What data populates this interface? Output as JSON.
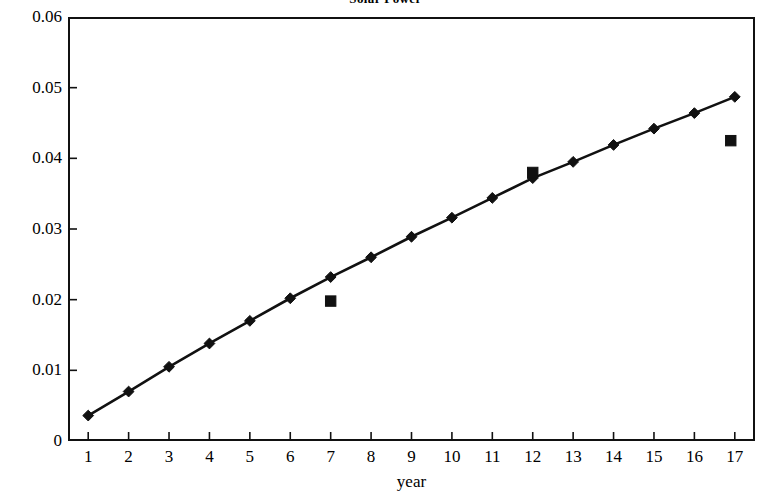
{
  "chart_data": {
    "type": "line",
    "title": "Solar Power",
    "xlabel": "year",
    "ylabel": "",
    "xlim": [
      0.5,
      17.5
    ],
    "ylim": [
      0,
      0.06
    ],
    "grid": false,
    "legend": "none",
    "x_tick_labels": [
      "1",
      "2",
      "3",
      "4",
      "5",
      "6",
      "7",
      "8",
      "9",
      "10",
      "11",
      "12",
      "13",
      "14",
      "15",
      "16",
      "17"
    ],
    "y_tick_labels": [
      "0",
      "0.01",
      "0.02",
      "0.03",
      "0.04",
      "0.05",
      "0.06"
    ],
    "y_tick_values": [
      0,
      0.01,
      0.02,
      0.03,
      0.04,
      0.05,
      0.06
    ],
    "categories": [
      1,
      2,
      3,
      4,
      5,
      6,
      7,
      8,
      9,
      10,
      11,
      12,
      13,
      14,
      15,
      16,
      17
    ],
    "series": [
      {
        "name": "trend",
        "marker": "diamond",
        "line": true,
        "color": "#111111",
        "x": [
          1,
          2,
          3,
          4,
          5,
          6,
          7,
          8,
          9,
          10,
          11,
          12,
          13,
          14,
          15,
          16,
          17
        ],
        "values": [
          0.0036,
          0.007,
          0.0105,
          0.0138,
          0.017,
          0.0202,
          0.0232,
          0.026,
          0.0289,
          0.0316,
          0.0344,
          0.0372,
          0.0395,
          0.0419,
          0.0442,
          0.0464,
          0.0487
        ]
      },
      {
        "name": "observed",
        "marker": "square",
        "line": false,
        "color": "#111111",
        "x": [
          7,
          12,
          16.9
        ],
        "values": [
          0.0198,
          0.038,
          0.0425
        ]
      }
    ]
  },
  "axes": {
    "x_title": "year",
    "y_title": ""
  }
}
